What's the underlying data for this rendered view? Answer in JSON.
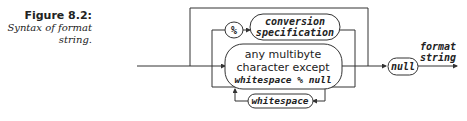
{
  "caption": {
    "title": "Figure 8.2:",
    "subtitle_line1": "Syntax of format",
    "subtitle_line2": "string."
  },
  "diagram": {
    "type": "syntax-railroad",
    "nodes": {
      "percent": "%",
      "conversion_line1": "conversion",
      "conversion_line2": "specification",
      "multibyte_line1": "any multibyte",
      "multibyte_line2": "character except",
      "multibyte_line3": "whitespace % null",
      "whitespace": "whitespace",
      "null": "null"
    },
    "output_label_line1": "format",
    "output_label_line2": "string",
    "line_color": "#333333"
  }
}
